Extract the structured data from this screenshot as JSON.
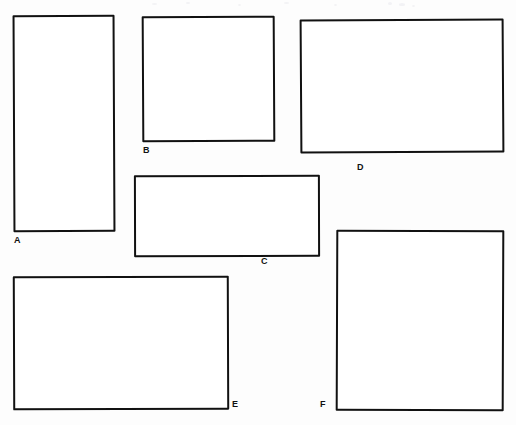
{
  "page": {
    "background_color": "#fdfdfd",
    "stroke_color": "#111111",
    "fill_color": "#ffffff",
    "width": 516,
    "height": 425
  },
  "shapes": [
    {
      "id": "rect-a",
      "label": "A",
      "kind": "rectangle",
      "x": 13,
      "y": 15,
      "width": 102,
      "height": 217,
      "label_x": 14,
      "label_y": 236
    },
    {
      "id": "rect-b",
      "label": "B",
      "kind": "rectangle",
      "x": 142,
      "y": 16,
      "width": 133,
      "height": 126,
      "label_x": 143,
      "label_y": 146
    },
    {
      "id": "rect-c",
      "label": "C",
      "kind": "rectangle",
      "x": 134,
      "y": 175,
      "width": 186,
      "height": 82,
      "label_x": 261,
      "label_y": 257
    },
    {
      "id": "rect-d",
      "label": "D",
      "kind": "rectangle",
      "x": 300,
      "y": 19,
      "width": 204,
      "height": 134,
      "label_x": 357,
      "label_y": 163
    },
    {
      "id": "rect-e",
      "label": "E",
      "kind": "rectangle",
      "x": 13,
      "y": 276,
      "width": 216,
      "height": 134,
      "label_x": 232,
      "label_y": 400
    },
    {
      "id": "rect-f",
      "label": "F",
      "kind": "rectangle",
      "x": 336,
      "y": 230,
      "width": 168,
      "height": 181,
      "label_x": 320,
      "label_y": 400
    }
  ]
}
